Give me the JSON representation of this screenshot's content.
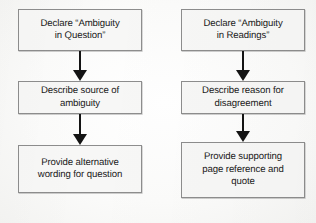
{
  "diagram": {
    "type": "flowchart",
    "title": "",
    "background_color": "#fdfdfc",
    "node_fill_color": "#f7f7f6",
    "node_border_color": "#8d8d8d",
    "arrow_color": "#141414",
    "columns": [
      {
        "name": "ambiguity-in-question",
        "nodes": [
          {
            "id": "left-node-1",
            "text": "Declare “Ambiguity\nin Question”"
          },
          {
            "id": "left-node-2",
            "text": "Describe source of\nambiguity"
          },
          {
            "id": "left-node-3",
            "text": "Provide alternative\nwording for question"
          }
        ],
        "connectors": [
          {
            "id": "left-arrow-1",
            "from": "left-node-1",
            "to": "left-node-2",
            "glyph": "down-arrow"
          },
          {
            "id": "left-arrow-2",
            "from": "left-node-2",
            "to": "left-node-3",
            "glyph": "down-arrow"
          }
        ]
      },
      {
        "name": "ambiguity-in-readings",
        "nodes": [
          {
            "id": "right-node-1",
            "text": "Declare “Ambiguity\nin Readings”"
          },
          {
            "id": "right-node-2",
            "text": "Describe reason for\ndisagreement"
          },
          {
            "id": "right-node-3",
            "text": "Provide supporting\npage reference and\nquote"
          }
        ],
        "connectors": [
          {
            "id": "right-arrow-1",
            "from": "right-node-1",
            "to": "right-node-2",
            "glyph": "down-arrow"
          },
          {
            "id": "right-arrow-2",
            "from": "right-node-2",
            "to": "right-node-3",
            "glyph": "down-arrow"
          }
        ]
      }
    ]
  }
}
